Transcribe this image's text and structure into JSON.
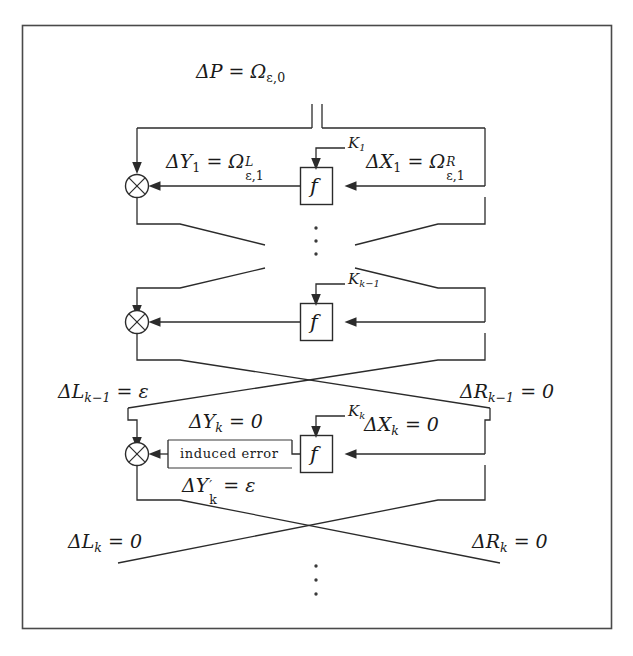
{
  "figure": {
    "type": "feistel-cipher-differential-diagram",
    "title_text": "",
    "frame": {
      "stroke": "#4a4a4a"
    },
    "colors": {
      "line": "#2b2b2b",
      "text": "#1a1a1a",
      "background": "#ffffff"
    }
  },
  "labels": {
    "plaintext_diff": "ΔP = Ω",
    "plaintext_diff_sub": "ε,0",
    "round1": {
      "left_out": "ΔY",
      "left_out_sub": "1",
      "left_eq": " = Ω",
      "left_sup": "L",
      "left_sub": "ε,1",
      "right_in": "ΔX",
      "right_in_sub": "1",
      "right_eq": " = Ω",
      "right_sup": "R",
      "right_sub": "ε,1",
      "key": "K",
      "key_sub": "1",
      "fbox": "f"
    },
    "round_km1": {
      "key": "K",
      "key_sub": "k−1",
      "fbox": "f"
    },
    "mid_left": "ΔL",
    "mid_left_sub": "k−1",
    "mid_left_eq": " = ε",
    "mid_right": "ΔR",
    "mid_right_sub": "k−1",
    "mid_right_eq": " = 0",
    "round_k": {
      "left_out": "ΔY",
      "left_out_sub": "k",
      "left_eq": " = 0",
      "induced": "induced error",
      "left_prime": "ΔY",
      "left_prime_sub": "k",
      "left_prime_eq": " = ε",
      "right_in": "ΔX",
      "right_in_sub": "k",
      "right_eq": " = 0",
      "key": "K",
      "key_sub": "k",
      "fbox": "f"
    },
    "bottom_left": "ΔL",
    "bottom_left_sub": "k",
    "bottom_left_eq": " = 0",
    "bottom_right": "ΔR",
    "bottom_right_sub": "k",
    "bottom_right_eq": " = 0",
    "ellipsis_upper": "⋮",
    "ellipsis_lower": "⋮"
  }
}
